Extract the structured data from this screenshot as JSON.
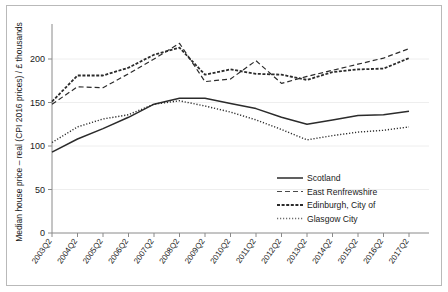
{
  "chart_data": {
    "type": "line",
    "title": "",
    "xlabel": "",
    "ylabel": "Median house price – real (CPI 2016 prices) / £ thousands",
    "ylim": [
      0,
      230
    ],
    "yticks": [
      0,
      50,
      100,
      150,
      200
    ],
    "ytick_labels": [
      "0",
      "50",
      "100",
      "150",
      "200"
    ],
    "grid": true,
    "legend_position": "inside lower right",
    "categories": [
      "2003Q2",
      "2004Q2",
      "2005Q2",
      "2006Q2",
      "2007Q2",
      "2008Q2",
      "2009Q2",
      "2010Q2",
      "2011Q2",
      "2012Q2",
      "2013Q2",
      "2014Q2",
      "2015Q2",
      "2016Q2",
      "2017Q2"
    ],
    "series": [
      {
        "name": "Scotland",
        "style": "solid",
        "color": "#2b2b2b",
        "values": [
          93,
          108,
          120,
          133,
          148,
          155,
          155,
          149,
          143,
          133,
          125,
          130,
          135,
          136,
          140
        ]
      },
      {
        "name": "East Renfrewshire",
        "style": "dashed",
        "color": "#4a4a4a",
        "values": [
          148,
          168,
          167,
          183,
          200,
          218,
          174,
          177,
          198,
          172,
          180,
          187,
          194,
          201,
          212
        ]
      },
      {
        "name": "Edinburgh, City of",
        "style": "dense-dash",
        "color": "#2b2b2b",
        "values": [
          151,
          181,
          181,
          190,
          205,
          213,
          182,
          188,
          183,
          182,
          176,
          185,
          188,
          189,
          201
        ]
      },
      {
        "name": "Glasgow City",
        "style": "dotted",
        "color": "#6e6e6e",
        "values": [
          104,
          122,
          131,
          136,
          148,
          152,
          146,
          139,
          130,
          119,
          107,
          112,
          116,
          118,
          122
        ]
      }
    ]
  },
  "legend": {
    "entries": [
      {
        "label": "Scotland",
        "style": "solid"
      },
      {
        "label": "East Renfrewshire",
        "style": "dashed"
      },
      {
        "label": "Edinburgh, City of",
        "style": "dense-dash"
      },
      {
        "label": "Glasgow City",
        "style": "dotted"
      }
    ]
  },
  "axes": {
    "y_title": "Median house price – real (CPI 2016 prices) / £ thousands"
  }
}
